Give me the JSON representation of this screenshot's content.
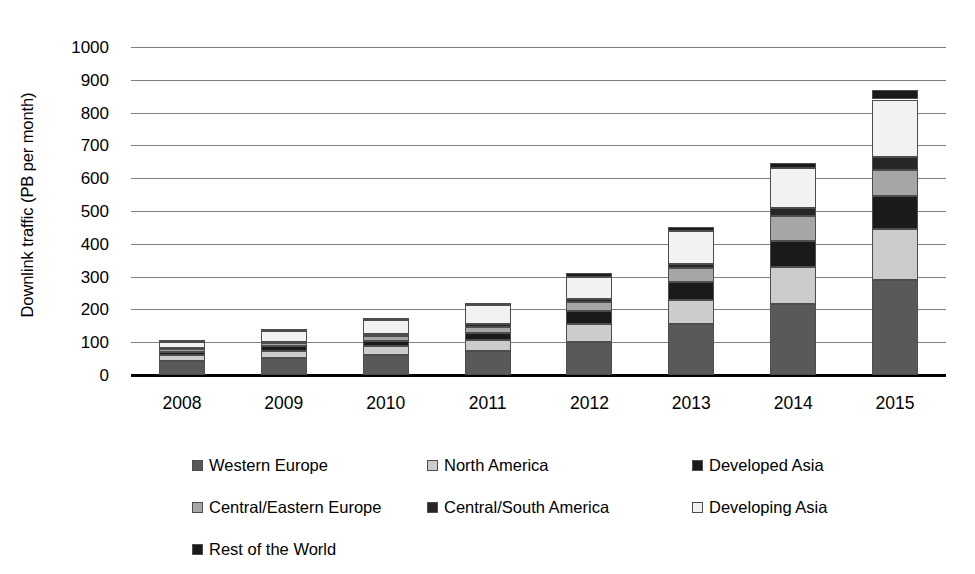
{
  "chart_data": {
    "type": "bar",
    "subtype": "stacked-bar",
    "title": "",
    "xlabel": "",
    "ylabel": "Downlink traffic (PB per month)",
    "categories": [
      "2008",
      "2009",
      "2010",
      "2011",
      "2012",
      "2013",
      "2014",
      "2015"
    ],
    "ylim": [
      0,
      1000
    ],
    "ytick_values": [
      0,
      100,
      200,
      300,
      400,
      500,
      600,
      700,
      800,
      900,
      1000
    ],
    "ytick_labels": [
      "0",
      "100",
      "200",
      "300",
      "400",
      "500",
      "600",
      "700",
      "800",
      "900",
      "1000"
    ],
    "grid": true,
    "legend_position": "bottom",
    "legend_columns": 3,
    "series": [
      {
        "name": "Western Europe",
        "color": "#595959",
        "values": [
          42,
          52,
          60,
          72,
          100,
          157,
          215,
          290
        ]
      },
      {
        "name": "North America",
        "color": "#cccccc",
        "values": [
          18,
          22,
          28,
          35,
          55,
          73,
          115,
          155
        ]
      },
      {
        "name": "Developed Asia",
        "color": "#1a1a1a",
        "values": [
          10,
          13,
          17,
          22,
          40,
          55,
          80,
          100
        ]
      },
      {
        "name": "Central/Eastern Europe",
        "color": "#a6a6a6",
        "values": [
          8,
          10,
          13,
          17,
          27,
          40,
          75,
          80
        ]
      },
      {
        "name": "Central/South America",
        "color": "#262626",
        "values": [
          4,
          5,
          7,
          9,
          10,
          12,
          25,
          40
        ]
      },
      {
        "name": "Developing Asia",
        "color": "#f2f2f2",
        "values": [
          20,
          31,
          42,
          57,
          68,
          103,
          120,
          175
        ]
      },
      {
        "name": "Rest of the World",
        "color": "#1a1a1a",
        "values": [
          3,
          4,
          5,
          8,
          10,
          10,
          15,
          28
        ]
      }
    ],
    "totals": [
      105,
      137,
      172,
      220,
      310,
      450,
      645,
      868
    ]
  },
  "axis": {
    "y_title": "Downlink traffic (PB per month)"
  },
  "legend": {
    "items": [
      {
        "label": "Western Europe",
        "color": "#595959"
      },
      {
        "label": "North America",
        "color": "#cccccc"
      },
      {
        "label": "Developed Asia",
        "color": "#1a1a1a"
      },
      {
        "label": "Central/Eastern Europe",
        "color": "#a6a6a6"
      },
      {
        "label": "Central/South America",
        "color": "#262626"
      },
      {
        "label": "Developing Asia",
        "color": "#f2f2f2"
      },
      {
        "label": "Rest of the World",
        "color": "#1a1a1a"
      }
    ]
  }
}
